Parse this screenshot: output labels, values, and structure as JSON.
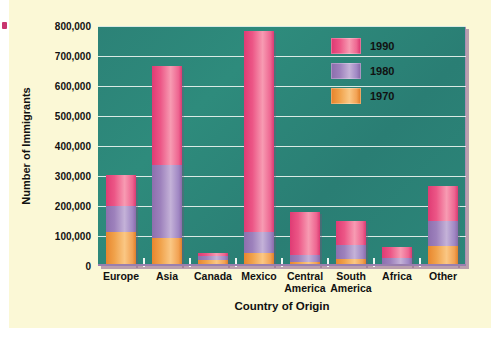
{
  "chart_data": {
    "type": "bar",
    "subtype": "stacked-bar",
    "title": "",
    "xlabel": "Country of Origin",
    "ylabel": "Number of Immigrants",
    "categories": [
      "Europe",
      "Asia",
      "Canada",
      "Mexico",
      "Central America",
      "South America",
      "Africa",
      "Other"
    ],
    "series": [
      {
        "name": "1970",
        "color": "#F0A24B",
        "values": [
          115000,
          92000,
          20000,
          45000,
          12000,
          25000,
          8000,
          68000
        ]
      },
      {
        "name": "1980",
        "color": "#A188C4",
        "values": [
          85000,
          245000,
          12000,
          70000,
          26000,
          45000,
          20000,
          82000
        ]
      },
      {
        "name": "1990",
        "color": "#EC5686",
        "values": [
          105000,
          330000,
          13000,
          669000,
          142000,
          80000,
          34000,
          117000
        ]
      }
    ],
    "totals": [
      305000,
      667000,
      45000,
      784000,
      180000,
      150000,
      62000,
      267000
    ],
    "ylim": [
      0,
      800000
    ],
    "ytick_labels": [
      "0",
      "100,000",
      "200,000",
      "300,000",
      "400,000",
      "500,000",
      "600,000",
      "700,000",
      "800,000"
    ],
    "ytick_values": [
      0,
      100000,
      200000,
      300000,
      400000,
      500000,
      600000,
      700000,
      800000
    ],
    "grid": true,
    "legend_position": "top-right",
    "legend_entries": [
      "1990",
      "1980",
      "1970"
    ],
    "plot_background_color": "#2E8B7C",
    "page_background_color": "#FBF8D6"
  },
  "axis": {
    "y_title": "Number of Immigrants",
    "x_title": "Country of Origin",
    "y_ticks": [
      {
        "label": "800,000"
      },
      {
        "label": "700,000"
      },
      {
        "label": "600,000"
      },
      {
        "label": "500,000"
      },
      {
        "label": "400,000"
      },
      {
        "label": "300,000"
      },
      {
        "label": "200,000"
      },
      {
        "label": "100,000"
      },
      {
        "label": "0"
      }
    ],
    "x_ticks": [
      {
        "label": "Europe"
      },
      {
        "label": "Asia"
      },
      {
        "label": "Canada"
      },
      {
        "label": "Mexico"
      },
      {
        "label": "Central\nAmerica"
      },
      {
        "label": "South\nAmerica"
      },
      {
        "label": "Africa"
      },
      {
        "label": "Other"
      }
    ]
  },
  "legend": {
    "items": [
      {
        "label": "1990",
        "color": "#EC5686"
      },
      {
        "label": "1980",
        "color": "#A188C4"
      },
      {
        "label": "1970",
        "color": "#F0A24B"
      }
    ]
  }
}
